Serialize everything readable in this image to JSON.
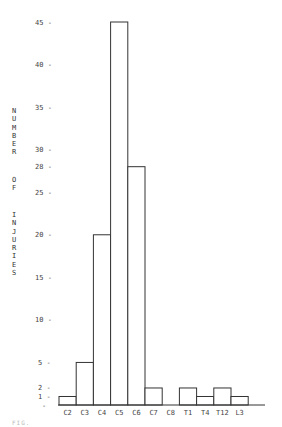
{
  "chart_data": {
    "type": "bar",
    "title": "",
    "xlabel": "",
    "ylabel": "NUMBER OF INJURIES",
    "categories": [
      "C2",
      "C3",
      "C4",
      "C5",
      "C6",
      "C7",
      "C8",
      "T1",
      "T4",
      "T12",
      "L3"
    ],
    "values": [
      1,
      5,
      20,
      45,
      28,
      2,
      0,
      2,
      1,
      2,
      1
    ],
    "yticks": [
      1,
      2,
      5,
      10,
      15,
      20,
      25,
      28,
      30,
      35,
      40,
      45
    ],
    "ylim": [
      0,
      45
    ],
    "grid": false,
    "legend": null
  },
  "ylabel_lines": {
    "word1": [
      "N",
      "U",
      "M",
      "B",
      "E",
      "R"
    ],
    "word2": [
      "O",
      "F"
    ],
    "word3": [
      "I",
      "N",
      "J",
      "U",
      "R",
      "I",
      "E",
      "S"
    ]
  },
  "caption": "FIG."
}
